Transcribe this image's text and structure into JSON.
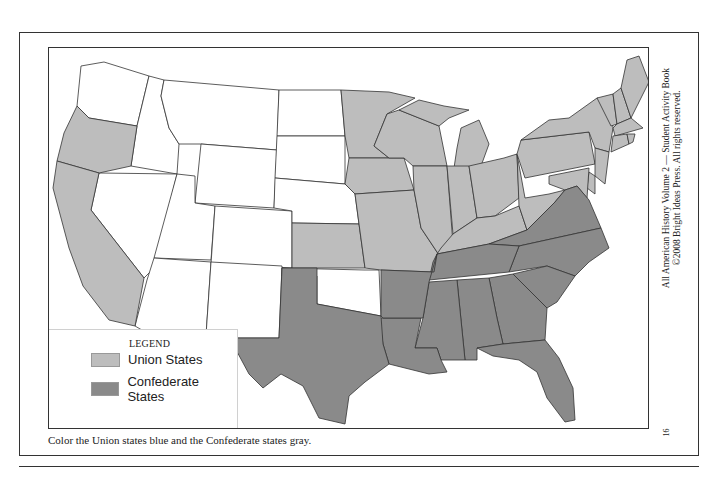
{
  "colors": {
    "union": "#bdbdbd",
    "confederate": "#8a8a8a",
    "unshaded": "#ffffff",
    "border": "#333333"
  },
  "legend": {
    "title": "LEGEND",
    "items": [
      {
        "label": "Union States",
        "category": "union"
      },
      {
        "label": "Confederate States",
        "category": "confederate"
      }
    ]
  },
  "caption": "Color the Union states blue and the Confederate states gray.",
  "side_text": {
    "line1": "All American History Volume 2 — Student Activity Book",
    "line2": "©2008 Bright Ideas Press. All rights reserved."
  },
  "page_number": "16",
  "map": {
    "title": "Union and Confederate States",
    "union_states": [
      "Oregon",
      "California",
      "Minnesota",
      "Iowa",
      "Kansas",
      "Missouri",
      "Wisconsin",
      "Michigan",
      "Illinois",
      "Indiana",
      "Ohio",
      "Kentucky",
      "West Virginia",
      "Pennsylvania",
      "New York",
      "Vermont",
      "New Hampshire",
      "Maine",
      "Massachusetts",
      "Rhode Island",
      "Connecticut",
      "New Jersey",
      "Delaware",
      "Maryland"
    ],
    "confederate_states": [
      "Texas",
      "Arkansas",
      "Louisiana",
      "Mississippi",
      "Alabama",
      "Tennessee",
      "Georgia",
      "Florida",
      "South Carolina",
      "North Carolina",
      "Virginia"
    ],
    "unshaded_states": [
      "Washington",
      "Idaho",
      "Montana",
      "Wyoming",
      "Nevada",
      "Utah",
      "Colorado",
      "Arizona",
      "New Mexico",
      "North Dakota",
      "South Dakota",
      "Nebraska",
      "Oklahoma"
    ]
  }
}
